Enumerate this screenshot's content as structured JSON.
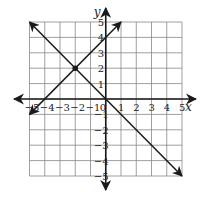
{
  "chart_data": {
    "type": "line",
    "title": "",
    "xlabel": "x",
    "ylabel": "y",
    "xlim": [
      -5,
      5
    ],
    "ylim": [
      -5,
      5
    ],
    "grid": true,
    "x_ticks": [
      -5,
      -4,
      -3,
      -2,
      -1,
      0,
      1,
      2,
      3,
      4,
      5
    ],
    "y_ticks": [
      -5,
      -4,
      -3,
      -2,
      -1,
      1,
      2,
      3,
      4,
      5
    ],
    "x_tick_labels": [
      "−5",
      "−4",
      "−3",
      "−2",
      "−1",
      "0",
      "1",
      "2",
      "3",
      "4",
      "5"
    ],
    "y_tick_labels": [
      "−5",
      "−4",
      "−3",
      "−2",
      "−1",
      "1",
      "2",
      "3",
      "4",
      "5"
    ],
    "series": [
      {
        "name": "y = -x",
        "points": [
          [
            -5,
            5
          ],
          [
            5,
            -5
          ]
        ],
        "arrows": "both"
      },
      {
        "name": "y = x + 4",
        "points": [
          [
            -5,
            -1
          ],
          [
            1,
            5
          ]
        ],
        "arrows": "both"
      }
    ],
    "annotations": [
      {
        "type": "point",
        "x": -2,
        "y": 2,
        "label": "intersection"
      }
    ]
  },
  "colors": {
    "grid": "#888888",
    "line": "#1a1a1a",
    "axis": "#1a1a1a"
  }
}
